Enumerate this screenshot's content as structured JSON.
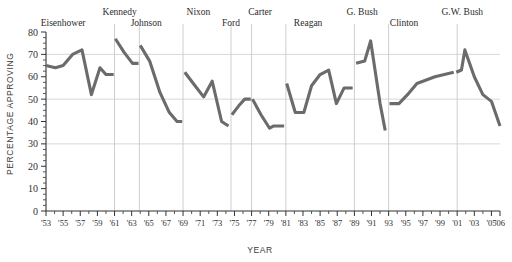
{
  "chart_data": {
    "type": "line",
    "title": "",
    "xlabel": "YEAR",
    "ylabel": "PERCENTAGE APPROVING",
    "ylim": [
      0,
      80
    ],
    "xlim": [
      1953,
      2006
    ],
    "yticks": [
      0,
      10,
      20,
      30,
      40,
      50,
      60,
      70,
      80
    ],
    "ytick_labels": [
      "0",
      "10",
      "20",
      "30",
      "40",
      "50",
      "60",
      "70",
      "80"
    ],
    "xticks": [
      1953,
      1955,
      1957,
      1959,
      1961,
      1963,
      1965,
      1967,
      1969,
      1971,
      1973,
      1975,
      1977,
      1979,
      1981,
      1983,
      1985,
      1987,
      1989,
      1991,
      1993,
      1995,
      1997,
      1999,
      2001,
      2003,
      2005,
      2006
    ],
    "xtick_labels": [
      "'53",
      "'55",
      "'57",
      "'59",
      "'61",
      "'63",
      "'65",
      "'67",
      "'69",
      "'71",
      "'73",
      "'75",
      "'77",
      "'79",
      "'81",
      "'83",
      "'85",
      "'87",
      "'89",
      "'91",
      "93",
      "'95",
      "'97",
      "'99",
      "'01",
      "'03",
      "'05",
      "'06"
    ],
    "grid": "horizontal gridlines at 30, 50, 70; vertical separators at presidential term boundaries",
    "legend": "none",
    "line_color": "#6b6b6b",
    "administration_labels": [
      {
        "name": "Eisenhower",
        "x": 1955.0,
        "row": 1
      },
      {
        "name": "Kennedy",
        "x": 1961.6,
        "row": 0
      },
      {
        "name": "Johnson",
        "x": 1964.7,
        "row": 1
      },
      {
        "name": "Nixon",
        "x": 1970.8,
        "row": 0
      },
      {
        "name": "Ford",
        "x": 1974.6,
        "row": 1
      },
      {
        "name": "Carter",
        "x": 1978.0,
        "row": 0
      },
      {
        "name": "Reagan",
        "x": 1983.6,
        "row": 1
      },
      {
        "name": "G. Bush",
        "x": 1989.9,
        "row": 0
      },
      {
        "name": "Clinton",
        "x": 1994.8,
        "row": 1
      },
      {
        "name": "G.W. Bush",
        "x": 2001.6,
        "row": 0
      }
    ],
    "administration_boundaries": [
      1953,
      1961,
      1963.9,
      1969,
      1974.6,
      1977,
      1981,
      1989,
      1993,
      2001
    ],
    "series": [
      {
        "name": "Eisenhower",
        "points": [
          {
            "x": 1953.0,
            "y": 65
          },
          {
            "x": 1954.1,
            "y": 64
          },
          {
            "x": 1955.0,
            "y": 65
          },
          {
            "x": 1956.1,
            "y": 70
          },
          {
            "x": 1957.2,
            "y": 72
          },
          {
            "x": 1958.3,
            "y": 52
          },
          {
            "x": 1959.3,
            "y": 64
          },
          {
            "x": 1960.0,
            "y": 61
          },
          {
            "x": 1960.9,
            "y": 61
          }
        ]
      },
      {
        "name": "Kennedy",
        "points": [
          {
            "x": 1961.1,
            "y": 77
          },
          {
            "x": 1962.1,
            "y": 71
          },
          {
            "x": 1963.1,
            "y": 66
          },
          {
            "x": 1963.8,
            "y": 66
          }
        ]
      },
      {
        "name": "Johnson",
        "points": [
          {
            "x": 1964.0,
            "y": 74
          },
          {
            "x": 1965.1,
            "y": 67
          },
          {
            "x": 1966.3,
            "y": 53
          },
          {
            "x": 1967.4,
            "y": 44
          },
          {
            "x": 1968.3,
            "y": 40
          },
          {
            "x": 1968.9,
            "y": 40
          }
        ]
      },
      {
        "name": "Nixon",
        "points": [
          {
            "x": 1969.2,
            "y": 62
          },
          {
            "x": 1970.4,
            "y": 56
          },
          {
            "x": 1971.4,
            "y": 51
          },
          {
            "x": 1972.4,
            "y": 58
          },
          {
            "x": 1973.5,
            "y": 40
          },
          {
            "x": 1974.3,
            "y": 38
          }
        ]
      },
      {
        "name": "Ford",
        "points": [
          {
            "x": 1974.7,
            "y": 43
          },
          {
            "x": 1975.5,
            "y": 47
          },
          {
            "x": 1976.2,
            "y": 50
          },
          {
            "x": 1976.9,
            "y": 50
          }
        ]
      },
      {
        "name": "Carter",
        "points": [
          {
            "x": 1977.1,
            "y": 50
          },
          {
            "x": 1978.1,
            "y": 43
          },
          {
            "x": 1979.1,
            "y": 37
          },
          {
            "x": 1979.6,
            "y": 38
          },
          {
            "x": 1980.8,
            "y": 38
          }
        ]
      },
      {
        "name": "Reagan",
        "points": [
          {
            "x": 1981.1,
            "y": 57
          },
          {
            "x": 1982.1,
            "y": 44
          },
          {
            "x": 1983.1,
            "y": 44
          },
          {
            "x": 1984.0,
            "y": 56
          },
          {
            "x": 1985.0,
            "y": 61
          },
          {
            "x": 1986.0,
            "y": 63
          },
          {
            "x": 1986.9,
            "y": 48
          },
          {
            "x": 1987.8,
            "y": 55
          },
          {
            "x": 1988.8,
            "y": 55
          }
        ]
      },
      {
        "name": "G. Bush",
        "points": [
          {
            "x": 1989.2,
            "y": 66
          },
          {
            "x": 1990.2,
            "y": 67
          },
          {
            "x": 1990.9,
            "y": 76
          },
          {
            "x": 1992.0,
            "y": 48
          },
          {
            "x": 1992.6,
            "y": 36
          }
        ]
      },
      {
        "name": "Clinton",
        "points": [
          {
            "x": 1993.1,
            "y": 48
          },
          {
            "x": 1994.2,
            "y": 48
          },
          {
            "x": 1995.2,
            "y": 52
          },
          {
            "x": 1996.3,
            "y": 57
          },
          {
            "x": 1998.4,
            "y": 60
          },
          {
            "x": 2000.6,
            "y": 62
          }
        ]
      },
      {
        "name": "G.W. Bush",
        "points": [
          {
            "x": 2000.9,
            "y": 62
          },
          {
            "x": 2001.5,
            "y": 63
          },
          {
            "x": 2001.9,
            "y": 72
          },
          {
            "x": 2003.0,
            "y": 60
          },
          {
            "x": 2004.0,
            "y": 52
          },
          {
            "x": 2005.0,
            "y": 49
          },
          {
            "x": 2006.0,
            "y": 38
          }
        ]
      }
    ]
  }
}
